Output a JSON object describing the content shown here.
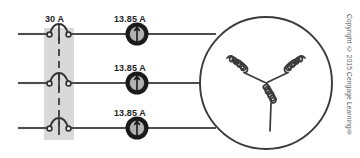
{
  "diagram": {
    "type": "three-phase-circuit-schematic",
    "background_color": "#ffffff",
    "line_color": "#4d4d4d",
    "shade_color": "#d9d9d9",
    "breaker": {
      "rating_label": "30 A",
      "poles": 3,
      "shaded_enclosure": true,
      "tie_bar_style": "dashed"
    },
    "ammeters": [
      {
        "reading_label": "13.85 A",
        "phase": "L1"
      },
      {
        "reading_label": "13.85 A",
        "phase": "L2"
      },
      {
        "reading_label": "13.85 A",
        "phase": "L3"
      }
    ],
    "motor": {
      "symbol": "circle",
      "winding_connection": "wye",
      "coil_count": 3
    },
    "copyright": "Copyright © 2015 Cengage Learning®"
  }
}
